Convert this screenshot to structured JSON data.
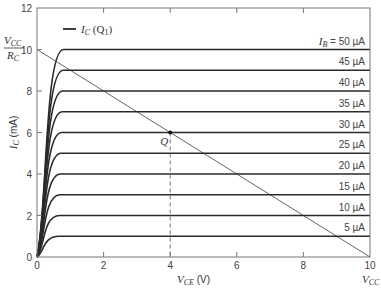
{
  "chart_data": {
    "type": "line",
    "title": "",
    "xlabel": "V_CE (V)",
    "ylabel": "I_C (mA)",
    "xlim": [
      0,
      10
    ],
    "ylim": [
      0,
      12
    ],
    "x_ticks": [
      0,
      2,
      4,
      6,
      8,
      10
    ],
    "y_ticks": [
      0,
      2,
      4,
      6,
      8,
      10,
      12
    ],
    "grid": false,
    "legend": {
      "position": "top-left",
      "entries": [
        "I_C (Q_1)"
      ]
    },
    "series": [
      {
        "name": "I_B = 50 µA",
        "label": "I_B = 50 µA",
        "ic_sat_mA": 10
      },
      {
        "name": "45 µA",
        "label": "45 µA",
        "ic_sat_mA": 9
      },
      {
        "name": "40 µA",
        "label": "40 µA",
        "ic_sat_mA": 8
      },
      {
        "name": "35 µA",
        "label": "35 µA",
        "ic_sat_mA": 7
      },
      {
        "name": "30 µA",
        "label": "30 µA",
        "ic_sat_mA": 6
      },
      {
        "name": "25 µA",
        "label": "25 µA",
        "ic_sat_mA": 5
      },
      {
        "name": "20 µA",
        "label": "20 µA",
        "ic_sat_mA": 4
      },
      {
        "name": "15 µA",
        "label": "15 µA",
        "ic_sat_mA": 3
      },
      {
        "name": "10 µA",
        "label": "10 µA",
        "ic_sat_mA": 2
      },
      {
        "name": "5 µA",
        "label": "5 µA",
        "ic_sat_mA": 1
      }
    ],
    "load_line": {
      "x": [
        0,
        10
      ],
      "y": [
        10,
        0
      ]
    },
    "annotations": [
      {
        "text": "Q",
        "x": 4,
        "y": 6,
        "note": "operating point with dashed drop line to x=4"
      },
      {
        "text": "V_CC / R_C",
        "at": "y=10"
      },
      {
        "text": "V_CC",
        "at": "x=10"
      }
    ]
  },
  "labels": {
    "legend": "I_C (Q_1)",
    "xlabel_main": "V",
    "xlabel_sub": "CE",
    "xlabel_unit": " (V)",
    "ylabel_main": "I",
    "ylabel_sub": "C",
    "ylabel_unit": " (mA)",
    "q_point": "Q",
    "vcc_num": "V",
    "vcc_sub": "CC",
    "rc_main": "R",
    "rc_sub": "C"
  }
}
